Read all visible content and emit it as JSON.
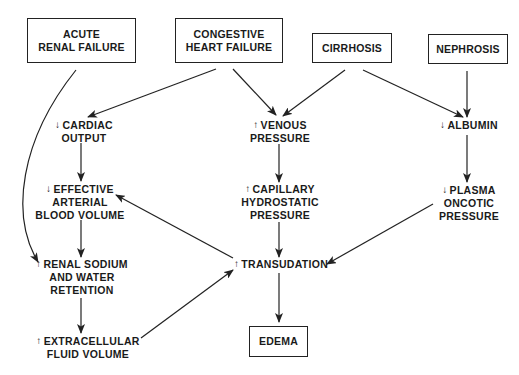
{
  "diagram": {
    "type": "flowchart",
    "causes": [
      {
        "id": "arf",
        "lines": [
          "ACUTE",
          "RENAL FAILURE"
        ]
      },
      {
        "id": "chf",
        "lines": [
          "CONGESTIVE",
          "HEART FAILURE"
        ]
      },
      {
        "id": "cirrhosis",
        "lines": [
          "CIRRHOSIS"
        ]
      },
      {
        "id": "nephrosis",
        "lines": [
          "NEPHROSIS"
        ]
      }
    ],
    "intermediates": [
      {
        "id": "cardiac_output",
        "direction": "down",
        "arrow_glyph": "↓",
        "lines": [
          "CARDIAC",
          "OUTPUT"
        ]
      },
      {
        "id": "venous_pressure",
        "direction": "up",
        "arrow_glyph": "↑",
        "lines": [
          "VENOUS",
          "PRESSURE"
        ]
      },
      {
        "id": "albumin",
        "direction": "down",
        "arrow_glyph": "↓",
        "lines": [
          "ALBUMIN"
        ]
      },
      {
        "id": "eabv",
        "direction": "down",
        "arrow_glyph": "↓",
        "lines": [
          "EFFECTIVE",
          "ARTERIAL",
          "BLOOD VOLUME"
        ]
      },
      {
        "id": "cap_hydro",
        "direction": "up",
        "arrow_glyph": "↑",
        "lines": [
          "CAPILLARY",
          "HYDROSTATIC",
          "PRESSURE"
        ]
      },
      {
        "id": "plasma_oncotic",
        "direction": "down",
        "arrow_glyph": "↓",
        "lines": [
          "PLASMA",
          "ONCOTIC",
          "PRESSURE"
        ]
      },
      {
        "id": "renal_na",
        "direction": "up",
        "arrow_glyph": "↑",
        "lines": [
          "RENAL SODIUM",
          "AND WATER",
          "RETENTION"
        ]
      },
      {
        "id": "transudation",
        "direction": "up",
        "arrow_glyph": "↑",
        "lines": [
          "TRANSUDATION"
        ]
      },
      {
        "id": "ecf",
        "direction": "up",
        "arrow_glyph": "↑",
        "lines": [
          "EXTRACELLULAR",
          "FLUID VOLUME"
        ]
      }
    ],
    "outcome": {
      "id": "edema",
      "lines": [
        "EDEMA"
      ]
    },
    "edges": [
      {
        "from": "arf",
        "to": "renal_na",
        "style": "curved"
      },
      {
        "from": "chf",
        "to": "cardiac_output"
      },
      {
        "from": "chf",
        "to": "venous_pressure"
      },
      {
        "from": "cirrhosis",
        "to": "venous_pressure"
      },
      {
        "from": "cirrhosis",
        "to": "albumin"
      },
      {
        "from": "nephrosis",
        "to": "albumin"
      },
      {
        "from": "cardiac_output",
        "to": "eabv"
      },
      {
        "from": "venous_pressure",
        "to": "cap_hydro"
      },
      {
        "from": "albumin",
        "to": "plasma_oncotic"
      },
      {
        "from": "eabv",
        "to": "renal_na"
      },
      {
        "from": "transudation",
        "to": "eabv"
      },
      {
        "from": "cap_hydro",
        "to": "transudation"
      },
      {
        "from": "plasma_oncotic",
        "to": "transudation"
      },
      {
        "from": "renal_na",
        "to": "ecf"
      },
      {
        "from": "ecf",
        "to": "transudation"
      },
      {
        "from": "transudation",
        "to": "edema"
      }
    ],
    "colors": {
      "line": "#222222",
      "text": "#1a1a1a",
      "background": "#ffffff"
    }
  }
}
